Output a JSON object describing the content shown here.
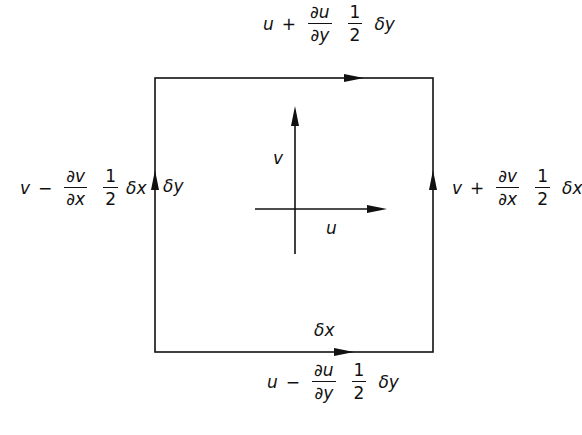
{
  "diagram": {
    "title": "",
    "colors": {
      "line": "#111111",
      "background": "#ffffff"
    },
    "element_box": {
      "sides": [
        "top",
        "right",
        "bottom",
        "left"
      ],
      "circulation": "arrows along each edge"
    },
    "center_axes": {
      "vertical_label": "v",
      "horizontal_label": "u"
    },
    "edge_labels": {
      "width": "δx",
      "height": "δy"
    },
    "top": {
      "base": "u",
      "op": "+",
      "num": "∂u",
      "den": "∂y",
      "half_num": "1",
      "half_den": "2",
      "delta": "δy"
    },
    "bottom": {
      "base": "u",
      "op": "−",
      "num": "∂u",
      "den": "∂y",
      "half_num": "1",
      "half_den": "2",
      "delta": "δy"
    },
    "left": {
      "base": "v",
      "op": "−",
      "num": "∂v",
      "den": "∂x",
      "half_num": "1",
      "half_den": "2",
      "delta": "δx"
    },
    "right": {
      "base": "v",
      "op": "+",
      "num": "∂v",
      "den": "∂x",
      "half_num": "1",
      "half_den": "2",
      "delta": "δx"
    }
  }
}
